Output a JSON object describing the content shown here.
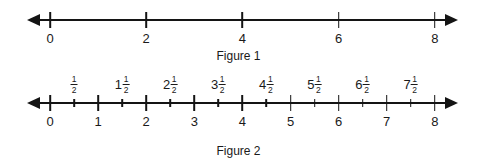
{
  "figures": [
    {
      "id": "figure-1",
      "caption": "Figure 1",
      "axis": {
        "min": 0,
        "max": 8,
        "left_arrow": "left-arrow-icon",
        "right_arrow": "right-arrow-icon",
        "major_ticks": [
          0,
          2,
          4,
          6,
          8
        ],
        "major_tick_labels": [
          "0",
          "2",
          "4",
          "6",
          "8"
        ],
        "minor_ticks": []
      }
    },
    {
      "id": "figure-2",
      "caption": "Figure 2",
      "axis": {
        "min": 0,
        "max": 8,
        "left_arrow": "left-arrow-icon",
        "right_arrow": "right-arrow-icon",
        "major_ticks": [
          0,
          1,
          2,
          3,
          4,
          5,
          6,
          7,
          8
        ],
        "major_tick_labels": [
          "0",
          "1",
          "2",
          "3",
          "4",
          "5",
          "6",
          "7",
          "8"
        ],
        "minor_ticks": [
          0.5,
          1.5,
          2.5,
          3.5,
          4.5,
          5.5,
          6.5,
          7.5
        ],
        "minor_tick_labels": [
          {
            "value": 0.5,
            "whole": "",
            "numerator": "1",
            "denominator": "2"
          },
          {
            "value": 1.5,
            "whole": "1",
            "numerator": "1",
            "denominator": "2"
          },
          {
            "value": 2.5,
            "whole": "2",
            "numerator": "1",
            "denominator": "2"
          },
          {
            "value": 3.5,
            "whole": "3",
            "numerator": "1",
            "denominator": "2"
          },
          {
            "value": 4.5,
            "whole": "4",
            "numerator": "1",
            "denominator": "2"
          },
          {
            "value": 5.5,
            "whole": "5",
            "numerator": "1",
            "denominator": "2"
          },
          {
            "value": 6.5,
            "whole": "6",
            "numerator": "1",
            "denominator": "2"
          },
          {
            "value": 7.5,
            "whole": "7",
            "numerator": "1",
            "denominator": "2"
          }
        ]
      }
    }
  ],
  "geometry": {
    "value_zero_x": 50,
    "pixels_per_unit": 48.1
  },
  "colors": {
    "ink": "#141414",
    "text": "#1a1a1a",
    "background": "#ffffff"
  }
}
